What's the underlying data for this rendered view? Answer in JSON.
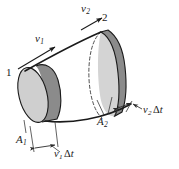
{
  "figure": {
    "labels": {
      "v2": {
        "symbol": "v",
        "subscript": "2",
        "text": "v2"
      },
      "point2": "2",
      "v1": {
        "symbol": "v",
        "subscript": "1",
        "text": "v1"
      },
      "point1": "1",
      "area1": {
        "symbol": "A",
        "subscript": "1",
        "text": "A1"
      },
      "area2": {
        "symbol": "A",
        "subscript": "2",
        "text": "A2"
      },
      "length1": {
        "symbol": "v",
        "subscript": "1",
        "delta": "Δ",
        "variable": "t",
        "text": "v1 Δt"
      },
      "length2": {
        "symbol": "v",
        "subscript": "2",
        "delta": "Δ",
        "variable": "t",
        "text": "v2 Δt"
      }
    },
    "colors": {
      "outline": "#1a1a1a",
      "slab_dark": "#8a8a8a",
      "face_light": "#cfcfcf",
      "face_light2": "#d8d8d8",
      "tube_fill": "#ffffff",
      "background": "#ffffff",
      "leader": "#4a4a4a"
    }
  }
}
